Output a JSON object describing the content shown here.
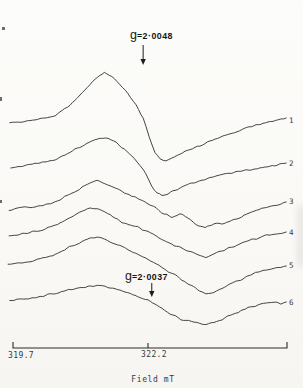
{
  "figure": {
    "kind": "scanned EPR spectra figure",
    "background": "#fbfaf7",
    "line_color": "#2f2f2f",
    "text_color": "#3a3a3a"
  },
  "chart_data": {
    "type": "line",
    "title": "",
    "xlabel": "Field mT",
    "ylabel": "",
    "x_tick_labels": [
      "319.7",
      "322.2"
    ],
    "x_ticks_mT": [
      319.7,
      322.2
    ],
    "x_range_mT": [
      319.61,
      324.77
    ],
    "y_units": "intensity, arbitrary units (six vertically stacked first-derivative EPR traces)",
    "grid": false,
    "legend": "none (traces numbered 1-6 at right edge)",
    "annotations": [
      {
        "label": "g=2·0048",
        "prefix": "g",
        "value": "=2·0048",
        "field_mT": 322.11,
        "text_x_px": 130,
        "text_baseline_y_px": 39,
        "arrow_y1_px": 45,
        "arrow_y2_px": 65
      },
      {
        "label": "g=2·0037",
        "prefix": "g",
        "value": "=2·0037",
        "field_mT": 322.27,
        "text_x_px": 125,
        "text_baseline_y_px": 280,
        "arrow_y1_px": 283,
        "arrow_y2_px": 297
      }
    ],
    "layout": {
      "width": 303,
      "height": 388,
      "x0_px": 13,
      "px_per_mT": 54,
      "axis_y_px": 348,
      "axis_x1_px": 13,
      "axis_x2_px": 287,
      "tick_len_px": 6,
      "label_x_px": 289
    },
    "series": [
      {
        "name": "1",
        "noise_px": 1.0,
        "label_y_px": 120,
        "points": [
          [
            319.64,
            225
          ],
          [
            319.92,
            226
          ],
          [
            320.2,
            229
          ],
          [
            320.48,
            233
          ],
          [
            320.66,
            239
          ],
          [
            320.85,
            247
          ],
          [
            321.03,
            258
          ],
          [
            321.22,
            269
          ],
          [
            321.39,
            276
          ],
          [
            321.53,
            272
          ],
          [
            321.68,
            264
          ],
          [
            321.83,
            254
          ],
          [
            321.98,
            243
          ],
          [
            322.11,
            230
          ],
          [
            322.22,
            212
          ],
          [
            322.33,
            196
          ],
          [
            322.42,
            189
          ],
          [
            322.53,
            187
          ],
          [
            322.64,
            190
          ],
          [
            322.79,
            194
          ],
          [
            322.98,
            199
          ],
          [
            323.16,
            202
          ],
          [
            323.35,
            207
          ],
          [
            323.53,
            211
          ],
          [
            323.76,
            215
          ],
          [
            323.98,
            219
          ],
          [
            324.2,
            223
          ],
          [
            324.42,
            226
          ],
          [
            324.61,
            228
          ],
          [
            324.76,
            230
          ]
        ]
      },
      {
        "name": "2",
        "noise_px": 1.0,
        "label_y_px": 163,
        "points": [
          [
            319.66,
            180
          ],
          [
            319.92,
            182
          ],
          [
            320.2,
            185
          ],
          [
            320.48,
            188
          ],
          [
            320.76,
            196
          ],
          [
            320.98,
            202
          ],
          [
            321.16,
            207
          ],
          [
            321.31,
            210
          ],
          [
            321.46,
            209
          ],
          [
            321.61,
            205
          ],
          [
            321.76,
            199
          ],
          [
            321.9,
            192
          ],
          [
            322.05,
            183
          ],
          [
            322.16,
            174
          ],
          [
            322.27,
            162
          ],
          [
            322.37,
            155
          ],
          [
            322.46,
            152
          ],
          [
            322.57,
            154
          ],
          [
            322.7,
            158
          ],
          [
            322.85,
            162
          ],
          [
            323.01,
            165
          ],
          [
            323.2,
            168
          ],
          [
            323.39,
            171
          ],
          [
            323.61,
            174
          ],
          [
            323.83,
            176
          ],
          [
            324.05,
            178
          ],
          [
            324.27,
            180
          ],
          [
            324.5,
            182
          ],
          [
            324.76,
            185
          ]
        ]
      },
      {
        "name": "3",
        "noise_px": 1.1,
        "label_y_px": 201,
        "points": [
          [
            319.63,
            138
          ],
          [
            319.87,
            140
          ],
          [
            320.11,
            142
          ],
          [
            320.35,
            144
          ],
          [
            320.57,
            148
          ],
          [
            320.79,
            155
          ],
          [
            320.98,
            161
          ],
          [
            321.13,
            165
          ],
          [
            321.26,
            167
          ],
          [
            321.4,
            165
          ],
          [
            321.55,
            161
          ],
          [
            321.72,
            156
          ],
          [
            321.89,
            152
          ],
          [
            322.05,
            149
          ],
          [
            322.2,
            145
          ],
          [
            322.35,
            140
          ],
          [
            322.5,
            134
          ],
          [
            322.64,
            131
          ],
          [
            322.79,
            134
          ],
          [
            322.94,
            130
          ],
          [
            323.09,
            124
          ],
          [
            323.26,
            120
          ],
          [
            323.42,
            125
          ],
          [
            323.61,
            124
          ],
          [
            323.79,
            128
          ],
          [
            323.98,
            133
          ],
          [
            324.16,
            137
          ],
          [
            324.35,
            140
          ],
          [
            324.53,
            142
          ],
          [
            324.76,
            146
          ]
        ]
      },
      {
        "name": "4",
        "noise_px": 1.1,
        "label_y_px": 232,
        "points": [
          [
            319.63,
            112
          ],
          [
            319.87,
            114
          ],
          [
            320.11,
            117
          ],
          [
            320.35,
            120
          ],
          [
            320.57,
            125
          ],
          [
            320.79,
            132
          ],
          [
            320.98,
            137
          ],
          [
            321.13,
            140
          ],
          [
            321.26,
            139
          ],
          [
            321.4,
            136
          ],
          [
            321.55,
            131
          ],
          [
            321.72,
            126
          ],
          [
            321.89,
            122
          ],
          [
            322.05,
            120
          ],
          [
            322.2,
            116
          ],
          [
            322.35,
            112
          ],
          [
            322.5,
            108
          ],
          [
            322.64,
            104
          ],
          [
            322.81,
            100
          ],
          [
            322.98,
            96
          ],
          [
            323.13,
            93
          ],
          [
            323.27,
            91
          ],
          [
            323.42,
            94
          ],
          [
            323.61,
            98
          ],
          [
            323.79,
            102
          ],
          [
            323.98,
            106
          ],
          [
            324.16,
            109
          ],
          [
            324.35,
            112
          ],
          [
            324.53,
            114
          ],
          [
            324.76,
            116
          ]
        ]
      },
      {
        "name": "5",
        "noise_px": 1.1,
        "label_y_px": 265,
        "points": [
          [
            319.61,
            84
          ],
          [
            319.87,
            86
          ],
          [
            320.11,
            88
          ],
          [
            320.35,
            91
          ],
          [
            320.57,
            96
          ],
          [
            320.79,
            102
          ],
          [
            320.98,
            107
          ],
          [
            321.13,
            110
          ],
          [
            321.26,
            111
          ],
          [
            321.4,
            109
          ],
          [
            321.55,
            105
          ],
          [
            321.72,
            101
          ],
          [
            321.89,
            97
          ],
          [
            322.05,
            93
          ],
          [
            322.2,
            89
          ],
          [
            322.35,
            84
          ],
          [
            322.5,
            79
          ],
          [
            322.66,
            74
          ],
          [
            322.83,
            68
          ],
          [
            323.0,
            62
          ],
          [
            323.16,
            57
          ],
          [
            323.27,
            54
          ],
          [
            323.42,
            56
          ],
          [
            323.57,
            60
          ],
          [
            323.72,
            64
          ],
          [
            323.87,
            67
          ],
          [
            324.05,
            72
          ],
          [
            324.24,
            76
          ],
          [
            324.42,
            79
          ],
          [
            324.61,
            81
          ],
          [
            324.76,
            82
          ]
        ]
      },
      {
        "name": "6",
        "noise_px": 1.2,
        "label_y_px": 302,
        "points": [
          [
            319.64,
            47
          ],
          [
            319.9,
            49
          ],
          [
            320.16,
            51
          ],
          [
            320.42,
            54
          ],
          [
            320.64,
            57
          ],
          [
            320.87,
            60
          ],
          [
            321.09,
            62
          ],
          [
            321.31,
            63
          ],
          [
            321.5,
            61
          ],
          [
            321.68,
            58
          ],
          [
            321.87,
            55
          ],
          [
            322.05,
            51
          ],
          [
            322.2,
            48
          ],
          [
            322.33,
            44
          ],
          [
            322.46,
            40
          ],
          [
            322.61,
            34
          ],
          [
            322.76,
            30
          ],
          [
            322.9,
            27
          ],
          [
            323.05,
            26
          ],
          [
            323.16,
            25
          ],
          [
            323.27,
            24
          ],
          [
            323.42,
            26
          ],
          [
            323.57,
            29
          ],
          [
            323.72,
            33
          ],
          [
            323.87,
            36
          ],
          [
            324.05,
            40
          ],
          [
            324.24,
            43
          ],
          [
            324.39,
            45
          ],
          [
            324.53,
            46
          ],
          [
            324.66,
            44
          ],
          [
            324.76,
            46
          ]
        ]
      }
    ]
  }
}
